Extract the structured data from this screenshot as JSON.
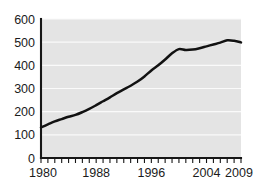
{
  "chart_data": {
    "type": "line",
    "title": "",
    "subtitle": "",
    "xlabel": "",
    "ylabel": "",
    "xlim": [
      1980,
      2009
    ],
    "ylim": [
      0,
      600
    ],
    "grid": true,
    "gridlines_y": [
      100,
      200,
      300,
      400,
      500,
      600
    ],
    "legend": null,
    "legend_position": "none",
    "annotations": [],
    "x_tick_labels": [
      "1980",
      "1988",
      "1996",
      "2004",
      "2009"
    ],
    "x_tick_label_values": [
      1980,
      1988,
      1996,
      2004,
      2009
    ],
    "x_minor_ticks_every": 1,
    "y_tick_labels": [
      "0",
      "100",
      "200",
      "300",
      "400",
      "500",
      "600"
    ],
    "y_tick_label_values": [
      0,
      100,
      200,
      300,
      400,
      500,
      600
    ],
    "x": [
      1980,
      1981,
      1982,
      1983,
      1984,
      1985,
      1986,
      1987,
      1988,
      1989,
      1990,
      1991,
      1992,
      1993,
      1994,
      1995,
      1996,
      1997,
      1998,
      1999,
      2000,
      2001,
      2002,
      2003,
      2004,
      2005,
      2006,
      2007,
      2008,
      2009
    ],
    "values": [
      132,
      145,
      158,
      168,
      178,
      186,
      198,
      212,
      228,
      245,
      262,
      280,
      296,
      312,
      330,
      352,
      378,
      400,
      425,
      452,
      470,
      466,
      468,
      474,
      482,
      490,
      498,
      508,
      506,
      499
    ],
    "series": [
      {
        "name": "series-1",
        "color": "#121212",
        "values": [
          132,
          145,
          158,
          168,
          178,
          186,
          198,
          212,
          228,
          245,
          262,
          280,
          296,
          312,
          330,
          352,
          378,
          400,
          425,
          452,
          470,
          466,
          468,
          474,
          482,
          490,
          498,
          508,
          506,
          499
        ]
      }
    ]
  },
  "style": {
    "plot_background": "#e4e4e4",
    "gridline_color": "#fafafa",
    "axis_color": "#161616",
    "line_color": "#121212",
    "page_background": "#ffffff"
  },
  "geometry": {
    "plot_left": 41,
    "plot_right": 241,
    "plot_top": 19,
    "plot_bottom": 158
  }
}
